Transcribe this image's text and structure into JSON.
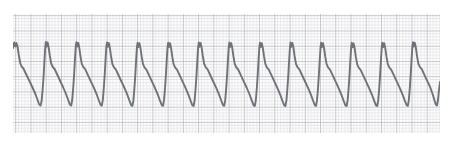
{
  "strip": {
    "title": "ECG rhythm strip",
    "lead_label": "",
    "waveform_name": "sawtooth-rhythm-trace",
    "paper": {
      "background_color": "#ffffff",
      "grid_minor_color": "#d8d8dc",
      "grid_major_color": "#a8a8b0",
      "trace_color": "#6f7277",
      "trace_width": 1.9,
      "minor_cell_px": 3.048,
      "major_cell_px": 15.24,
      "plot_left": 13,
      "plot_top": 14,
      "plot_right": 440,
      "plot_bottom": 133
    },
    "geometry": {
      "period_px": 30.5,
      "first_peak_x": 14,
      "peak_y": 42,
      "notch_y": 46,
      "trough_y": 105,
      "shoulder_y": 66,
      "baseline_y": 84,
      "cycle_count": 15
    }
  },
  "chart_data": {
    "type": "line",
    "xlabel": "",
    "ylabel": "",
    "grid": true,
    "legend": "none",
    "xlim": [
      13,
      440
    ],
    "ylim": [
      133,
      14
    ],
    "series": [
      {
        "name": "ecg-trace",
        "color": "#6f7277",
        "points": [
          [
            13.0,
            48.0
          ],
          [
            14.2,
            42.5
          ],
          [
            15.4,
            46.5
          ],
          [
            16.4,
            43.0
          ],
          [
            17.6,
            47.0
          ],
          [
            18.8,
            55.0
          ],
          [
            20.2,
            63.0
          ],
          [
            21.6,
            66.5
          ],
          [
            23.4,
            68.5
          ],
          [
            26.0,
            74.0
          ],
          [
            29.0,
            80.0
          ],
          [
            32.0,
            86.5
          ],
          [
            35.2,
            93.5
          ],
          [
            37.6,
            100.0
          ],
          [
            39.2,
            104.5
          ],
          [
            40.6,
            105.5
          ],
          [
            41.6,
            101.0
          ],
          [
            42.6,
            90.0
          ],
          [
            43.6,
            76.0
          ],
          [
            44.5,
            60.0
          ],
          [
            45.2,
            48.0
          ],
          [
            45.8,
            42.0
          ],
          [
            46.6,
            46.5
          ],
          [
            47.6,
            42.5
          ],
          [
            48.6,
            47.0
          ],
          [
            49.8,
            55.5
          ],
          [
            51.2,
            63.5
          ],
          [
            52.8,
            67.0
          ],
          [
            54.6,
            69.0
          ],
          [
            57.2,
            74.5
          ],
          [
            60.0,
            80.5
          ],
          [
            63.0,
            87.0
          ],
          [
            66.0,
            94.0
          ],
          [
            68.4,
            100.5
          ],
          [
            70.0,
            104.8
          ],
          [
            71.2,
            105.5
          ],
          [
            72.2,
            100.0
          ],
          [
            73.2,
            88.0
          ],
          [
            74.2,
            73.0
          ],
          [
            75.1,
            57.0
          ],
          [
            75.8,
            46.0
          ],
          [
            76.4,
            42.2
          ],
          [
            77.2,
            46.5
          ],
          [
            78.2,
            42.8
          ],
          [
            79.2,
            47.2
          ],
          [
            80.4,
            55.8
          ],
          [
            81.8,
            63.8
          ],
          [
            83.4,
            67.2
          ],
          [
            85.2,
            69.2
          ],
          [
            87.8,
            74.8
          ],
          [
            90.6,
            80.8
          ],
          [
            93.6,
            87.2
          ],
          [
            96.6,
            94.2
          ],
          [
            99.0,
            100.8
          ],
          [
            100.6,
            105.0
          ],
          [
            101.8,
            105.6
          ],
          [
            102.8,
            100.2
          ],
          [
            103.8,
            88.2
          ],
          [
            104.8,
            73.2
          ],
          [
            105.7,
            57.2
          ],
          [
            106.4,
            46.2
          ],
          [
            107.0,
            42.4
          ],
          [
            107.8,
            46.8
          ],
          [
            108.8,
            43.0
          ],
          [
            109.8,
            47.4
          ],
          [
            111.0,
            56.0
          ],
          [
            112.4,
            64.0
          ],
          [
            114.0,
            67.4
          ],
          [
            115.8,
            69.4
          ],
          [
            118.4,
            75.0
          ],
          [
            121.2,
            81.0
          ],
          [
            124.2,
            87.4
          ],
          [
            127.2,
            94.4
          ],
          [
            129.6,
            101.0
          ],
          [
            131.2,
            105.2
          ],
          [
            132.4,
            105.8
          ],
          [
            133.4,
            100.4
          ],
          [
            134.4,
            88.4
          ],
          [
            135.4,
            73.4
          ],
          [
            136.3,
            57.4
          ],
          [
            137.0,
            46.4
          ],
          [
            137.6,
            42.6
          ],
          [
            138.4,
            47.0
          ],
          [
            139.4,
            43.2
          ],
          [
            140.4,
            47.6
          ],
          [
            141.6,
            56.2
          ],
          [
            143.0,
            64.2
          ],
          [
            144.6,
            67.6
          ],
          [
            146.4,
            69.6
          ],
          [
            149.0,
            75.2
          ],
          [
            151.8,
            81.2
          ],
          [
            154.8,
            87.6
          ],
          [
            157.8,
            94.6
          ],
          [
            160.2,
            101.2
          ],
          [
            161.8,
            105.2
          ],
          [
            163.0,
            105.8
          ],
          [
            164.0,
            100.4
          ],
          [
            165.0,
            88.4
          ],
          [
            166.0,
            73.4
          ],
          [
            166.9,
            57.4
          ],
          [
            167.6,
            46.4
          ],
          [
            168.2,
            42.6
          ],
          [
            169.0,
            47.0
          ],
          [
            170.0,
            43.2
          ],
          [
            171.0,
            47.6
          ],
          [
            172.2,
            56.2
          ],
          [
            173.6,
            64.2
          ],
          [
            175.2,
            67.6
          ],
          [
            177.0,
            69.6
          ],
          [
            179.6,
            75.2
          ],
          [
            182.4,
            81.2
          ],
          [
            185.4,
            87.6
          ],
          [
            188.4,
            94.6
          ],
          [
            190.8,
            101.2
          ],
          [
            192.4,
            105.4
          ],
          [
            193.6,
            106.0
          ],
          [
            194.6,
            100.6
          ],
          [
            195.6,
            88.6
          ],
          [
            196.6,
            73.6
          ],
          [
            197.5,
            57.6
          ],
          [
            198.2,
            46.6
          ],
          [
            198.8,
            42.4
          ],
          [
            199.6,
            46.8
          ],
          [
            200.6,
            43.0
          ],
          [
            201.6,
            47.4
          ],
          [
            202.8,
            56.0
          ],
          [
            204.2,
            64.0
          ],
          [
            205.8,
            67.4
          ],
          [
            207.6,
            69.4
          ],
          [
            210.2,
            75.0
          ],
          [
            213.0,
            81.0
          ],
          [
            216.0,
            87.4
          ],
          [
            219.0,
            94.4
          ],
          [
            221.4,
            101.0
          ],
          [
            223.0,
            105.2
          ],
          [
            224.2,
            105.8
          ],
          [
            225.2,
            100.4
          ],
          [
            226.2,
            88.4
          ],
          [
            227.2,
            73.4
          ],
          [
            228.1,
            57.4
          ],
          [
            228.8,
            46.4
          ],
          [
            229.4,
            42.5
          ],
          [
            230.2,
            46.9
          ],
          [
            231.2,
            43.1
          ],
          [
            232.2,
            47.5
          ],
          [
            233.4,
            56.1
          ],
          [
            234.8,
            64.1
          ],
          [
            236.4,
            67.5
          ],
          [
            238.2,
            69.5
          ],
          [
            240.8,
            75.1
          ],
          [
            243.6,
            81.1
          ],
          [
            246.6,
            87.5
          ],
          [
            249.6,
            94.5
          ],
          [
            252.0,
            101.1
          ],
          [
            253.6,
            105.3
          ],
          [
            254.8,
            105.9
          ],
          [
            255.8,
            100.5
          ],
          [
            256.8,
            88.5
          ],
          [
            257.8,
            73.5
          ],
          [
            258.7,
            57.5
          ],
          [
            259.4,
            46.5
          ],
          [
            260.0,
            42.6
          ],
          [
            260.8,
            47.0
          ],
          [
            261.8,
            43.2
          ],
          [
            262.8,
            47.6
          ],
          [
            264.0,
            56.2
          ],
          [
            265.4,
            64.2
          ],
          [
            267.0,
            67.6
          ],
          [
            268.8,
            69.6
          ],
          [
            271.4,
            75.2
          ],
          [
            274.2,
            81.2
          ],
          [
            277.2,
            87.6
          ],
          [
            280.2,
            94.6
          ],
          [
            282.6,
            101.2
          ],
          [
            284.2,
            105.4
          ],
          [
            285.4,
            106.0
          ],
          [
            286.4,
            100.6
          ],
          [
            287.4,
            88.6
          ],
          [
            288.4,
            73.6
          ],
          [
            289.3,
            57.6
          ],
          [
            290.0,
            46.6
          ],
          [
            290.6,
            42.4
          ],
          [
            291.4,
            46.8
          ],
          [
            292.4,
            43.0
          ],
          [
            293.4,
            47.4
          ],
          [
            294.6,
            56.0
          ],
          [
            296.0,
            64.0
          ],
          [
            297.6,
            67.4
          ],
          [
            299.4,
            69.4
          ],
          [
            302.0,
            75.0
          ],
          [
            304.8,
            81.0
          ],
          [
            307.8,
            87.4
          ],
          [
            310.8,
            94.4
          ],
          [
            313.2,
            101.0
          ],
          [
            314.8,
            105.2
          ],
          [
            316.0,
            105.8
          ],
          [
            317.0,
            100.4
          ],
          [
            318.0,
            88.4
          ],
          [
            319.0,
            73.4
          ],
          [
            319.9,
            57.4
          ],
          [
            320.6,
            46.4
          ],
          [
            321.2,
            42.6
          ],
          [
            322.0,
            47.0
          ],
          [
            323.0,
            43.2
          ],
          [
            324.0,
            47.6
          ],
          [
            325.2,
            56.2
          ],
          [
            326.6,
            64.2
          ],
          [
            328.2,
            67.6
          ],
          [
            330.0,
            69.6
          ],
          [
            332.6,
            75.2
          ],
          [
            335.4,
            81.2
          ],
          [
            338.4,
            87.6
          ],
          [
            341.4,
            94.6
          ],
          [
            343.8,
            101.2
          ],
          [
            345.4,
            105.4
          ],
          [
            346.6,
            106.0
          ],
          [
            347.6,
            100.6
          ],
          [
            348.6,
            88.6
          ],
          [
            349.6,
            73.6
          ],
          [
            350.5,
            57.6
          ],
          [
            351.2,
            46.6
          ],
          [
            351.8,
            42.8
          ],
          [
            352.6,
            47.2
          ],
          [
            353.6,
            43.4
          ],
          [
            354.6,
            47.8
          ],
          [
            355.8,
            56.4
          ],
          [
            357.2,
            64.4
          ],
          [
            358.8,
            67.8
          ],
          [
            360.6,
            69.8
          ],
          [
            363.2,
            75.4
          ],
          [
            366.0,
            81.4
          ],
          [
            369.0,
            87.8
          ],
          [
            372.0,
            94.8
          ],
          [
            374.4,
            101.4
          ],
          [
            376.0,
            105.4
          ],
          [
            377.2,
            106.0
          ],
          [
            378.2,
            100.6
          ],
          [
            379.2,
            88.6
          ],
          [
            380.2,
            73.6
          ],
          [
            381.1,
            57.6
          ],
          [
            381.8,
            46.6
          ],
          [
            382.4,
            42.6
          ],
          [
            383.2,
            47.0
          ],
          [
            384.2,
            43.2
          ],
          [
            385.2,
            47.6
          ],
          [
            386.4,
            56.2
          ],
          [
            387.8,
            64.2
          ],
          [
            389.4,
            67.6
          ],
          [
            391.2,
            69.6
          ],
          [
            393.8,
            75.2
          ],
          [
            396.6,
            81.2
          ],
          [
            399.6,
            87.6
          ],
          [
            402.6,
            94.6
          ],
          [
            405.0,
            101.2
          ],
          [
            406.6,
            105.2
          ],
          [
            407.8,
            105.8
          ],
          [
            408.8,
            100.4
          ],
          [
            409.8,
            88.4
          ],
          [
            410.8,
            73.4
          ],
          [
            411.7,
            57.4
          ],
          [
            412.4,
            46.4
          ],
          [
            413.0,
            42.2
          ],
          [
            413.8,
            46.6
          ],
          [
            414.8,
            42.8
          ],
          [
            415.8,
            47.2
          ],
          [
            417.0,
            55.8
          ],
          [
            418.4,
            63.8
          ],
          [
            420.0,
            67.2
          ],
          [
            421.8,
            69.2
          ],
          [
            424.4,
            74.8
          ],
          [
            427.2,
            80.8
          ],
          [
            430.2,
            87.2
          ],
          [
            432.6,
            94.0
          ],
          [
            434.4,
            100.0
          ],
          [
            435.8,
            104.5
          ],
          [
            437.0,
            105.5
          ],
          [
            438.0,
            100.0
          ],
          [
            439.0,
            90.0
          ],
          [
            440.0,
            82.0
          ]
        ]
      }
    ]
  }
}
